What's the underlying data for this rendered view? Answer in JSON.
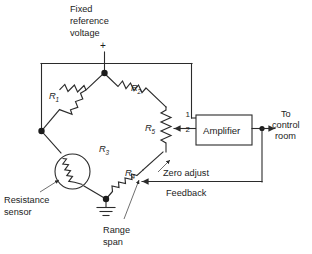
{
  "diagram": {
    "source_label": {
      "line1": "Fixed",
      "line2": "reference",
      "line3": "voltage",
      "polarity": "+"
    },
    "components": {
      "r1": {
        "name": "R",
        "subscript": "1"
      },
      "r2": {
        "name": "R",
        "subscript": "2"
      },
      "r3": {
        "name": "R",
        "subscript": "3"
      },
      "r4": {
        "name": "R",
        "subscript": "4"
      },
      "r5": {
        "name": "R",
        "subscript": "5"
      }
    },
    "amplifier": {
      "label": "Amplifier",
      "terminal_1": "1",
      "terminal_2": "2"
    },
    "annotations": {
      "resistance_sensor_line1": "Resistance",
      "resistance_sensor_line2": "sensor",
      "range_span_line1": "Range",
      "range_span_line2": "span",
      "zero_adjust": "Zero  adjust",
      "feedback": "Feedback",
      "output_line1": "To",
      "output_line2": "control",
      "output_line3": "room"
    },
    "icons": {
      "ground": "ground-symbol-icon",
      "sensor": "resistance-sensor-icon",
      "wiper_r5": "potentiometer-wiper-icon",
      "wiper_r4": "potentiometer-wiper-icon",
      "output_arrow": "arrow-right-icon",
      "feedback_arrow": "arrow-left-icon"
    },
    "colors": {
      "line": "#2b2b2b",
      "text": "#1c1c1c",
      "background": "#ffffff"
    }
  }
}
